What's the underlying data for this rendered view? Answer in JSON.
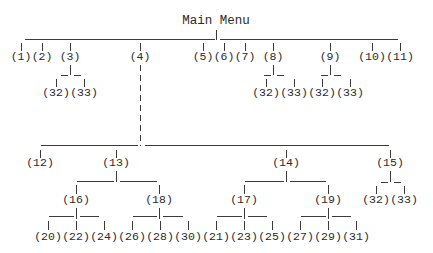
{
  "diagram": {
    "title": "Main Menu",
    "colors": {
      "ink": "#2a2a2a",
      "background": "#ffffff"
    },
    "nodes": [
      {
        "id": "root",
        "label": "Main Menu",
        "x": 216,
        "y": 21
      },
      {
        "id": "n1",
        "label": "(1)",
        "x": 21,
        "y": 57
      },
      {
        "id": "n2",
        "label": "(2)",
        "x": 42,
        "y": 57
      },
      {
        "id": "n3",
        "label": "(3)",
        "x": 70,
        "y": 57
      },
      {
        "id": "n4",
        "label": "(4)",
        "x": 140,
        "y": 57
      },
      {
        "id": "n5",
        "label": "(5)",
        "x": 203,
        "y": 57
      },
      {
        "id": "n6",
        "label": "(6)",
        "x": 224,
        "y": 57
      },
      {
        "id": "n7",
        "label": "(7)",
        "x": 245,
        "y": 57
      },
      {
        "id": "n8",
        "label": "(8)",
        "x": 273,
        "y": 57
      },
      {
        "id": "n9",
        "label": "(9)",
        "x": 330,
        "y": 57
      },
      {
        "id": "n10",
        "label": "(10)",
        "x": 372,
        "y": 57
      },
      {
        "id": "n11",
        "label": "(11)",
        "x": 400,
        "y": 57
      },
      {
        "id": "n3a",
        "label": "(32)",
        "x": 56,
        "y": 93
      },
      {
        "id": "n3b",
        "label": "(33)",
        "x": 84,
        "y": 93
      },
      {
        "id": "n8a",
        "label": "(32)",
        "x": 266,
        "y": 93
      },
      {
        "id": "n8b",
        "label": "(33)",
        "x": 294,
        "y": 93
      },
      {
        "id": "n9a",
        "label": "(32)",
        "x": 322,
        "y": 93
      },
      {
        "id": "n9b",
        "label": "(33)",
        "x": 350,
        "y": 93
      },
      {
        "id": "n12",
        "label": "(12)",
        "x": 40,
        "y": 163
      },
      {
        "id": "n13",
        "label": "(13)",
        "x": 116,
        "y": 163
      },
      {
        "id": "n14",
        "label": "(14)",
        "x": 286,
        "y": 163
      },
      {
        "id": "n15",
        "label": "(15)",
        "x": 390,
        "y": 163
      },
      {
        "id": "n15a",
        "label": "(32)",
        "x": 376,
        "y": 200
      },
      {
        "id": "n15b",
        "label": "(33)",
        "x": 404,
        "y": 200
      },
      {
        "id": "n16",
        "label": "(16)",
        "x": 76,
        "y": 200
      },
      {
        "id": "n18",
        "label": "(18)",
        "x": 159,
        "y": 200
      },
      {
        "id": "n17",
        "label": "(17)",
        "x": 244,
        "y": 200
      },
      {
        "id": "n19",
        "label": "(19)",
        "x": 328,
        "y": 200
      },
      {
        "id": "n20",
        "label": "(20)",
        "x": 48,
        "y": 237
      },
      {
        "id": "n22",
        "label": "(22)",
        "x": 76,
        "y": 237
      },
      {
        "id": "n24",
        "label": "(24)",
        "x": 104,
        "y": 237
      },
      {
        "id": "n26",
        "label": "(26)",
        "x": 132,
        "y": 237
      },
      {
        "id": "n28",
        "label": "(28)",
        "x": 160,
        "y": 237
      },
      {
        "id": "n30",
        "label": "(30)",
        "x": 188,
        "y": 237
      },
      {
        "id": "n21",
        "label": "(21)",
        "x": 216,
        "y": 237
      },
      {
        "id": "n23",
        "label": "(23)",
        "x": 244,
        "y": 237
      },
      {
        "id": "n25",
        "label": "(25)",
        "x": 272,
        "y": 237
      },
      {
        "id": "n27",
        "label": "(27)",
        "x": 300,
        "y": 237
      },
      {
        "id": "n29",
        "label": "(29)",
        "x": 328,
        "y": 237
      },
      {
        "id": "n31",
        "label": "(31)",
        "x": 356,
        "y": 237
      }
    ],
    "lines": [
      {
        "x1": 24,
        "y1": 39,
        "x2": 214,
        "y2": 39
      },
      {
        "x1": 219,
        "y1": 39,
        "x2": 397,
        "y2": 39
      },
      {
        "x1": 216,
        "y1": 29,
        "x2": 216,
        "y2": 39
      },
      {
        "x1": 21,
        "y1": 42,
        "x2": 21,
        "y2": 50
      },
      {
        "x1": 42,
        "y1": 42,
        "x2": 42,
        "y2": 50
      },
      {
        "x1": 70,
        "y1": 42,
        "x2": 70,
        "y2": 50
      },
      {
        "x1": 140,
        "y1": 42,
        "x2": 140,
        "y2": 50
      },
      {
        "x1": 203,
        "y1": 42,
        "x2": 203,
        "y2": 50
      },
      {
        "x1": 224,
        "y1": 42,
        "x2": 224,
        "y2": 50
      },
      {
        "x1": 245,
        "y1": 42,
        "x2": 245,
        "y2": 50
      },
      {
        "x1": 273,
        "y1": 42,
        "x2": 273,
        "y2": 50
      },
      {
        "x1": 330,
        "y1": 42,
        "x2": 330,
        "y2": 50
      },
      {
        "x1": 372,
        "y1": 42,
        "x2": 372,
        "y2": 50
      },
      {
        "x1": 400,
        "y1": 42,
        "x2": 400,
        "y2": 50
      },
      {
        "x1": 70,
        "y1": 64,
        "x2": 70,
        "y2": 74
      },
      {
        "x1": 60,
        "y1": 75,
        "x2": 67,
        "y2": 75
      },
      {
        "x1": 73,
        "y1": 75,
        "x2": 80,
        "y2": 75
      },
      {
        "x1": 56,
        "y1": 78,
        "x2": 56,
        "y2": 86
      },
      {
        "x1": 84,
        "y1": 78,
        "x2": 84,
        "y2": 86
      },
      {
        "x1": 273,
        "y1": 64,
        "x2": 273,
        "y2": 74
      },
      {
        "x1": 263,
        "y1": 75,
        "x2": 270,
        "y2": 75
      },
      {
        "x1": 276,
        "y1": 75,
        "x2": 283,
        "y2": 75
      },
      {
        "x1": 266,
        "y1": 78,
        "x2": 266,
        "y2": 86
      },
      {
        "x1": 294,
        "y1": 78,
        "x2": 294,
        "y2": 86
      },
      {
        "x1": 330,
        "y1": 64,
        "x2": 330,
        "y2": 74
      },
      {
        "x1": 320,
        "y1": 75,
        "x2": 327,
        "y2": 75
      },
      {
        "x1": 333,
        "y1": 75,
        "x2": 340,
        "y2": 75
      },
      {
        "x1": 322,
        "y1": 78,
        "x2": 322,
        "y2": 86
      },
      {
        "x1": 350,
        "y1": 78,
        "x2": 350,
        "y2": 86
      },
      {
        "x1": 140,
        "y1": 64,
        "x2": 140,
        "y2": 145,
        "dash": true
      },
      {
        "x1": 40,
        "y1": 145,
        "x2": 137,
        "y2": 145
      },
      {
        "x1": 144,
        "y1": 145,
        "x2": 388,
        "y2": 145
      },
      {
        "x1": 40,
        "y1": 149,
        "x2": 40,
        "y2": 157
      },
      {
        "x1": 116,
        "y1": 149,
        "x2": 116,
        "y2": 157
      },
      {
        "x1": 286,
        "y1": 149,
        "x2": 286,
        "y2": 157
      },
      {
        "x1": 390,
        "y1": 149,
        "x2": 390,
        "y2": 157
      },
      {
        "x1": 116,
        "y1": 170,
        "x2": 116,
        "y2": 181
      },
      {
        "x1": 76,
        "y1": 181,
        "x2": 113,
        "y2": 181
      },
      {
        "x1": 119,
        "y1": 181,
        "x2": 156,
        "y2": 181
      },
      {
        "x1": 76,
        "y1": 184,
        "x2": 76,
        "y2": 193
      },
      {
        "x1": 159,
        "y1": 184,
        "x2": 159,
        "y2": 193
      },
      {
        "x1": 286,
        "y1": 170,
        "x2": 286,
        "y2": 181
      },
      {
        "x1": 244,
        "y1": 181,
        "x2": 283,
        "y2": 181
      },
      {
        "x1": 289,
        "y1": 181,
        "x2": 325,
        "y2": 181
      },
      {
        "x1": 244,
        "y1": 184,
        "x2": 244,
        "y2": 193
      },
      {
        "x1": 328,
        "y1": 184,
        "x2": 328,
        "y2": 193
      },
      {
        "x1": 390,
        "y1": 170,
        "x2": 390,
        "y2": 181
      },
      {
        "x1": 380,
        "y1": 182,
        "x2": 387,
        "y2": 182
      },
      {
        "x1": 393,
        "y1": 182,
        "x2": 400,
        "y2": 182
      },
      {
        "x1": 376,
        "y1": 185,
        "x2": 376,
        "y2": 193
      },
      {
        "x1": 404,
        "y1": 185,
        "x2": 404,
        "y2": 193
      },
      {
        "x1": 76,
        "y1": 207,
        "x2": 76,
        "y2": 218
      },
      {
        "x1": 48,
        "y1": 216,
        "x2": 73,
        "y2": 216
      },
      {
        "x1": 79,
        "y1": 216,
        "x2": 98,
        "y2": 216
      },
      {
        "x1": 48,
        "y1": 220,
        "x2": 48,
        "y2": 229
      },
      {
        "x1": 76,
        "y1": 220,
        "x2": 76,
        "y2": 229
      },
      {
        "x1": 104,
        "y1": 220,
        "x2": 104,
        "y2": 229
      },
      {
        "x1": 159,
        "y1": 207,
        "x2": 159,
        "y2": 218
      },
      {
        "x1": 132,
        "y1": 216,
        "x2": 156,
        "y2": 216
      },
      {
        "x1": 162,
        "y1": 216,
        "x2": 182,
        "y2": 216
      },
      {
        "x1": 132,
        "y1": 220,
        "x2": 132,
        "y2": 229
      },
      {
        "x1": 160,
        "y1": 220,
        "x2": 160,
        "y2": 229
      },
      {
        "x1": 188,
        "y1": 220,
        "x2": 188,
        "y2": 229
      },
      {
        "x1": 244,
        "y1": 207,
        "x2": 244,
        "y2": 218
      },
      {
        "x1": 216,
        "y1": 216,
        "x2": 241,
        "y2": 216
      },
      {
        "x1": 247,
        "y1": 216,
        "x2": 266,
        "y2": 216
      },
      {
        "x1": 216,
        "y1": 220,
        "x2": 216,
        "y2": 229
      },
      {
        "x1": 244,
        "y1": 220,
        "x2": 244,
        "y2": 229
      },
      {
        "x1": 272,
        "y1": 220,
        "x2": 272,
        "y2": 229
      },
      {
        "x1": 328,
        "y1": 207,
        "x2": 328,
        "y2": 218
      },
      {
        "x1": 300,
        "y1": 216,
        "x2": 325,
        "y2": 216
      },
      {
        "x1": 331,
        "y1": 216,
        "x2": 350,
        "y2": 216
      },
      {
        "x1": 300,
        "y1": 220,
        "x2": 300,
        "y2": 229
      },
      {
        "x1": 328,
        "y1": 220,
        "x2": 328,
        "y2": 229
      },
      {
        "x1": 356,
        "y1": 220,
        "x2": 356,
        "y2": 229
      }
    ]
  }
}
